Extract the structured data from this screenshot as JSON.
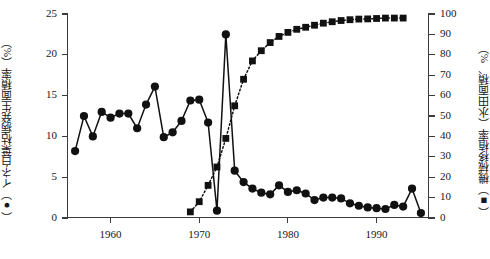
{
  "chart_data": {
    "type": "line",
    "title": "",
    "xlabel": "",
    "xlim": [
      1955.2,
      1995.8
    ],
    "xticks": [
      1960,
      1970,
      1980,
      1990
    ],
    "xticklabels": [
      "1960",
      "1970",
      "1980",
      "1990"
    ],
    "grid": false,
    "legend": "none",
    "axes": [
      {
        "side": "left",
        "label": "イネ白葉枯病発生面積率（%）",
        "marker": "filled-circle",
        "ylim": [
          0,
          25
        ],
        "yticks": [
          0,
          5,
          10,
          15,
          20,
          25
        ],
        "yticklabels": [
          "0",
          "5",
          "10",
          "15",
          "20",
          "25"
        ]
      },
      {
        "side": "right",
        "label": "機械移植率（水田面積、%）",
        "marker": "filled-square",
        "ylim": [
          0,
          100
        ],
        "yticks": [
          0,
          10,
          20,
          30,
          40,
          50,
          60,
          70,
          80,
          90,
          100
        ],
        "yticklabels": [
          "0",
          "10",
          "20",
          "30",
          "40",
          "50",
          "60",
          "70",
          "80",
          "90",
          "100"
        ]
      }
    ],
    "series": [
      {
        "name": "イネ白葉枯病発生面積率",
        "axis": "left",
        "marker": "filled-circle",
        "linestyle": "solid",
        "color": "#111111",
        "x": [
          1956,
          1957,
          1958,
          1959,
          1960,
          1961,
          1962,
          1963,
          1964,
          1965,
          1966,
          1967,
          1968,
          1969,
          1970,
          1971,
          1972,
          1973,
          1974,
          1975,
          1976,
          1977,
          1978,
          1979,
          1980,
          1981,
          1982,
          1983,
          1984,
          1985,
          1986,
          1987,
          1988,
          1989,
          1990,
          1991,
          1992,
          1993,
          1994,
          1995
        ],
        "y": [
          8.2,
          12.5,
          10.0,
          13.0,
          12.3,
          12.8,
          12.8,
          11.0,
          13.9,
          16.1,
          9.9,
          10.5,
          11.9,
          14.4,
          14.5,
          11.7,
          0.9,
          22.5,
          5.8,
          4.4,
          3.6,
          3.1,
          2.9,
          4.0,
          3.2,
          3.4,
          3.0,
          2.2,
          2.5,
          2.5,
          2.4,
          1.8,
          1.5,
          1.3,
          1.2,
          1.1,
          1.6,
          1.4,
          3.6,
          0.6
        ]
      },
      {
        "name": "機械移植率",
        "axis": "right",
        "marker": "filled-square",
        "linestyle": "dotted",
        "color": "#111111",
        "x": [
          1969,
          1970,
          1971,
          1972,
          1973,
          1974,
          1975,
          1976,
          1977,
          1978,
          1979,
          1980,
          1981,
          1982,
          1983,
          1984,
          1985,
          1986,
          1987,
          1988,
          1989,
          1990,
          1991,
          1992,
          1993
        ],
        "y": [
          3.0,
          8.0,
          16.0,
          25.0,
          39.0,
          55.0,
          68.0,
          77.0,
          82.0,
          86.0,
          89.0,
          91.0,
          92.5,
          93.5,
          94.5,
          95.5,
          96.2,
          96.8,
          97.2,
          97.5,
          97.6,
          97.8,
          98.0,
          98.0,
          98.0
        ]
      }
    ]
  }
}
